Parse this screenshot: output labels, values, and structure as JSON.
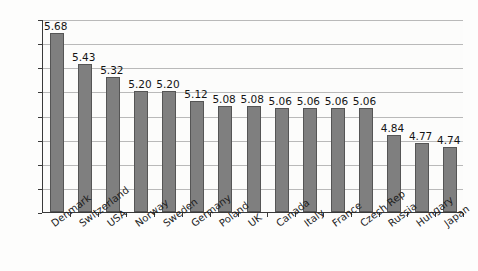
{
  "chart_data": {
    "type": "bar",
    "title": "",
    "subtitle": "",
    "xlabel": "",
    "ylabel": "",
    "ylim": [
      4.2,
      5.8
    ],
    "ytick_step": 0.2,
    "ytick_labels": [
      "5.80",
      "5.60",
      "5.40",
      "5.20",
      "5.00",
      "4.80",
      "4.60",
      "4.40",
      "4.20"
    ],
    "grid": true,
    "grid_axis": "y",
    "legend": false,
    "legend_position": "none",
    "value_labels": true,
    "value_label_format": "0.00",
    "categories": [
      "Denmark",
      "Switzerland",
      "USA",
      "Norway",
      "Sweden",
      "Germany",
      "Poland",
      "UK",
      "Canada",
      "Italy",
      "France",
      "Czech Rep",
      "Russia",
      "Hungary",
      "Japan"
    ],
    "values": [
      5.68,
      5.43,
      5.32,
      5.2,
      5.2,
      5.12,
      5.08,
      5.08,
      5.06,
      5.06,
      5.06,
      5.06,
      4.84,
      4.77,
      4.74
    ],
    "value_labels_text": [
      "5.68",
      "5.43",
      "5.32",
      "5.20",
      "5.20",
      "5.12",
      "5.08",
      "5.08",
      "5.06",
      "5.06",
      "5.06",
      "5.06",
      "4.84",
      "4.77",
      "4.74"
    ],
    "colors": {
      "bar_fill": "#7f7f7f",
      "bar_border": "#555555",
      "grid": "#b9b9b9",
      "axis": "#3a3a3a",
      "text": "#1c1c1c",
      "plot_background": "#fcfcfb",
      "figure_background": "#fdfdfc"
    }
  }
}
